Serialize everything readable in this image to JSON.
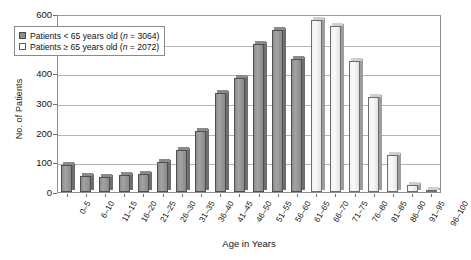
{
  "chart_data": {
    "type": "bar",
    "title": "",
    "xlabel": "Age in Years",
    "ylabel": "No. of Patients",
    "ylim": [
      0,
      600
    ],
    "yticks": [
      0,
      100,
      200,
      300,
      400,
      500,
      600
    ],
    "grid": true,
    "legend_position": "top-left",
    "categories": [
      "0–5",
      "6–10",
      "11–15",
      "16–20",
      "21–25",
      "26–30",
      "31–35",
      "36–40",
      "41–45",
      "46–50",
      "51–55",
      "56–60",
      "61–65",
      "66–70",
      "71–75",
      "76–80",
      "81–85",
      "86–90",
      "91–95",
      "96–100"
    ],
    "series": [
      {
        "name": "Patients < 65 years old (n = 3064)",
        "color": "#8f8f8f",
        "values": [
          90,
          55,
          50,
          58,
          60,
          100,
          140,
          205,
          335,
          385,
          500,
          545,
          450,
          null,
          null,
          null,
          null,
          null,
          null,
          null
        ]
      },
      {
        "name": "Patients ≥ 65 years old (n = 2072)",
        "color": "#ffffff",
        "values": [
          null,
          null,
          null,
          null,
          null,
          null,
          null,
          null,
          null,
          null,
          null,
          null,
          null,
          580,
          560,
          440,
          320,
          125,
          25,
          8
        ]
      }
    ],
    "bar_values": [
      90,
      55,
      50,
      58,
      60,
      100,
      140,
      205,
      335,
      385,
      500,
      545,
      450,
      580,
      560,
      440,
      320,
      125,
      25,
      8
    ],
    "bar_groups": [
      "under65",
      "under65",
      "under65",
      "under65",
      "under65",
      "under65",
      "under65",
      "under65",
      "under65",
      "under65",
      "under65",
      "under65",
      "under65",
      "over65",
      "over65",
      "over65",
      "over65",
      "over65",
      "over65",
      "over65"
    ]
  },
  "legend": {
    "items": [
      {
        "label_pre": "Patients < 65 years old (",
        "label_n": "n",
        "label_post": " = 3064)",
        "type": "dark"
      },
      {
        "label_pre": "Patients ≥ 65 years old (",
        "label_n": "n",
        "label_post": " = 2072)",
        "type": "light"
      }
    ]
  }
}
